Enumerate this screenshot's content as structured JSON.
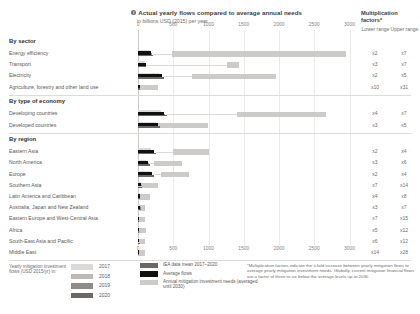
{
  "header": {
    "bullet": "f",
    "title": "Actual yearly flows compared to average annual needs",
    "subtitle": "in billions USD (2015) per year"
  },
  "multiplication": {
    "title": "Multiplication factors*",
    "lower_label": "Lower range",
    "upper_label": "Upper range"
  },
  "axis": {
    "ticks": [
      "0",
      "500",
      "1000",
      "1500",
      "2000",
      "2500",
      "3000"
    ],
    "tick_values": [
      0,
      500,
      1000,
      1500,
      2000,
      2500,
      3000
    ]
  },
  "groups": [
    {
      "title": "By sector",
      "rows": [
        {
          "label": "Energy efficiency",
          "lower": "x2",
          "upper": "x7"
        },
        {
          "label": "Transport",
          "lower": "x3",
          "upper": "x7"
        },
        {
          "label": "Electricity",
          "lower": "x2",
          "upper": "x5"
        },
        {
          "label": "Agriculture, forestry and other land use",
          "lower": "x10",
          "upper": "x31"
        }
      ]
    },
    {
      "title": "By type of economy",
      "rows": [
        {
          "label": "Developing countries",
          "lower": "x4",
          "upper": "x7"
        },
        {
          "label": "Developed countries",
          "lower": "x3",
          "upper": "x5"
        }
      ]
    },
    {
      "title": "By region",
      "rows": [
        {
          "label": "Eastern Asia",
          "lower": "x2",
          "upper": "x4"
        },
        {
          "label": "North America",
          "lower": "x3",
          "upper": "x6"
        },
        {
          "label": "Europe",
          "lower": "x2",
          "upper": "x4"
        },
        {
          "label": "Southern Asia",
          "lower": "x7",
          "upper": "x14"
        },
        {
          "label": "Latin America and Caribbean",
          "lower": "x4",
          "upper": "x8"
        },
        {
          "label": "Australia, Japan and New Zealand",
          "lower": "x3",
          "upper": "x7"
        },
        {
          "label": "Eastern Europe and West-Central Asia",
          "lower": "x7",
          "upper": "x15"
        },
        {
          "label": "Africa",
          "lower": "x5",
          "upper": "x12"
        },
        {
          "label": "South-East Asia and Pacific",
          "lower": "x6",
          "upper": "x12"
        },
        {
          "label": "Middle East",
          "lower": "x14",
          "upper": "x28"
        }
      ]
    }
  ],
  "legend": {
    "caption": "Yearly mitigation investment flows (USD 2015/yr) in:",
    "years": [
      {
        "label": "2017",
        "color": "#dcdad8"
      },
      {
        "label": "2018",
        "color": "#bcb9b6"
      },
      {
        "label": "2019",
        "color": "#8e8b88"
      },
      {
        "label": "2020",
        "color": "#6a6764"
      }
    ],
    "items": [
      {
        "label": "IEA data mean 2017–2020",
        "color": "#6a6764"
      },
      {
        "label": "Average flows",
        "color": "#111111"
      },
      {
        "label": "Annual mitigation investment needs (averaged until 2030)",
        "color": "#cdcbc9"
      }
    ]
  },
  "footnote": "*Multiplication factors indicate the x-fold increase between yearly mitigation flows to average yearly mitigation investment needs. Globally, current mitigation financial flows are a factor of three to six below the average levels up to 2030.",
  "chart_data": {
    "type": "bar",
    "title": "Actual yearly flows compared to average annual needs",
    "subtitle": "in billions USD (2015) per year",
    "xlabel": "billions USD (2015) per year",
    "ylabel": "",
    "xlim": [
      0,
      3100
    ],
    "grid": true,
    "legend_position": "bottom",
    "series_note": "Each row shows yearly mitigation investment flows (2017-2020 stacked segments plus average flow marker) against a light-gray range bar for annual mitigation investment needs averaged until 2030.",
    "rows": [
      {
        "category": "Energy efficiency",
        "group": "By sector",
        "flows": [
          170,
          185,
          200,
          215
        ],
        "flow_mean": 190,
        "average_flow": 190,
        "needs_low": 480,
        "needs_high": 2950,
        "factor_low": 2,
        "factor_high": 7
      },
      {
        "category": "Transport",
        "group": "By sector",
        "flows": [
          95,
          105,
          112,
          120
        ],
        "flow_mean": 108,
        "average_flow": 108,
        "needs_low": 1260,
        "needs_high": 1430,
        "factor_low": 3,
        "factor_high": 7
      },
      {
        "category": "Electricity",
        "group": "By sector",
        "flows": [
          300,
          320,
          345,
          370
        ],
        "flow_mean": 334,
        "average_flow": 334,
        "needs_low": 770,
        "needs_high": 1960,
        "factor_low": 2,
        "factor_high": 5
      },
      {
        "category": "Agriculture, forestry and other land use",
        "group": "By sector",
        "flows": [
          20,
          24,
          28,
          32
        ],
        "flow_mean": 26,
        "average_flow": 26,
        "needs_low": 0,
        "needs_high": 280,
        "factor_low": 10,
        "factor_high": 31
      },
      {
        "category": "Developing countries",
        "group": "By type of economy",
        "flows": [
          330,
          355,
          380,
          405
        ],
        "flow_mean": 368,
        "average_flow": 368,
        "needs_low": 1400,
        "needs_high": 2660,
        "factor_low": 4,
        "factor_high": 7
      },
      {
        "category": "Developed countries",
        "group": "By type of economy",
        "flows": [
          250,
          270,
          290,
          310
        ],
        "flow_mean": 280,
        "average_flow": 280,
        "needs_low": 200,
        "needs_high": 1000,
        "factor_low": 3,
        "factor_high": 5
      },
      {
        "category": "Eastern Asia",
        "group": "By region",
        "flows": [
          190,
          210,
          230,
          255
        ],
        "flow_mean": 220,
        "average_flow": 220,
        "needs_low": 500,
        "needs_high": 1000,
        "factor_low": 2,
        "factor_high": 4
      },
      {
        "category": "North America",
        "group": "By region",
        "flows": [
          120,
          135,
          150,
          165
        ],
        "flow_mean": 142,
        "average_flow": 142,
        "needs_low": 230,
        "needs_high": 620,
        "factor_low": 3,
        "factor_high": 6
      },
      {
        "category": "Europe",
        "group": "By region",
        "flows": [
          170,
          185,
          200,
          220
        ],
        "flow_mean": 194,
        "average_flow": 194,
        "needs_low": 330,
        "needs_high": 720,
        "factor_low": 2,
        "factor_high": 4
      },
      {
        "category": "Southern Asia",
        "group": "By region",
        "flows": [
          40,
          45,
          50,
          56
        ],
        "flow_mean": 48,
        "average_flow": 48,
        "needs_low": 20,
        "needs_high": 290,
        "factor_low": 7,
        "factor_high": 14
      },
      {
        "category": "Latin America and Caribbean",
        "group": "By region",
        "flows": [
          25,
          28,
          32,
          35
        ],
        "flow_mean": 30,
        "average_flow": 30,
        "needs_low": 10,
        "needs_high": 170,
        "factor_low": 4,
        "factor_high": 8
      },
      {
        "category": "Australia, Japan and New Zealand",
        "group": "By region",
        "flows": [
          30,
          33,
          36,
          40
        ],
        "flow_mean": 35,
        "average_flow": 35,
        "needs_low": 5,
        "needs_high": 100,
        "factor_low": 3,
        "factor_high": 7
      },
      {
        "category": "Eastern Europe and West-Central Asia",
        "group": "By region",
        "flows": [
          14,
          16,
          18,
          20
        ],
        "flow_mean": 17,
        "average_flow": 17,
        "needs_low": 5,
        "needs_high": 95,
        "factor_low": 7,
        "factor_high": 15
      },
      {
        "category": "Africa",
        "group": "By region",
        "flows": [
          14,
          16,
          18,
          21
        ],
        "flow_mean": 17,
        "average_flow": 17,
        "needs_low": 5,
        "needs_high": 110,
        "factor_low": 5,
        "factor_high": 12
      },
      {
        "category": "South-East Asia and Pacific",
        "group": "By region",
        "flows": [
          16,
          18,
          20,
          23
        ],
        "flow_mean": 19,
        "average_flow": 19,
        "needs_low": 5,
        "needs_high": 105,
        "factor_low": 6,
        "factor_high": 12
      },
      {
        "category": "Middle East",
        "group": "By region",
        "flows": [
          5,
          6,
          7,
          8
        ],
        "flow_mean": 6,
        "average_flow": 6,
        "needs_low": 5,
        "needs_high": 95,
        "factor_low": 14,
        "factor_high": 28
      }
    ]
  }
}
